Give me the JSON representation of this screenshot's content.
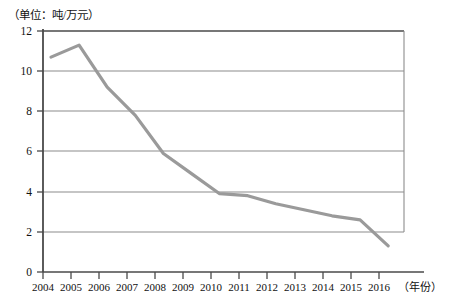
{
  "chart_data": {
    "type": "line",
    "title": "",
    "subtitle": "",
    "unit_label": "（单位：吨/万元）",
    "xlabel": "（年份）",
    "ylabel": "",
    "grid": true,
    "legend": false,
    "legend_position": "none",
    "xlim": [
      2004,
      2016
    ],
    "ylim": [
      0,
      12
    ],
    "ytick_labels": [
      "12",
      "10",
      "8",
      "6",
      "4",
      "2",
      "0"
    ],
    "ytick_values": [
      12,
      10,
      8,
      6,
      4,
      2,
      0
    ],
    "categories": [
      "2004",
      "2005",
      "2006",
      "2007",
      "2008",
      "2009",
      "2010",
      "2011",
      "2012",
      "2013",
      "2014",
      "2015",
      "2016"
    ],
    "x": [
      2004,
      2005,
      2006,
      2007,
      2008,
      2009,
      2010,
      2011,
      2012,
      2013,
      2014,
      2015,
      2016
    ],
    "values": [
      10.7,
      11.3,
      9.2,
      7.8,
      5.9,
      4.9,
      3.9,
      3.8,
      3.4,
      3.1,
      2.8,
      2.6,
      1.3
    ],
    "series": [
      {
        "name": "能耗",
        "values": [
          10.7,
          11.3,
          9.2,
          7.8,
          5.9,
          4.9,
          3.9,
          3.8,
          3.4,
          3.1,
          2.8,
          2.6,
          1.3
        ]
      }
    ],
    "colors": {
      "line": "#9a9a9a",
      "grid": "#8c8c8c",
      "axis": "#555555",
      "text": "#111111",
      "background": "#ffffff"
    }
  }
}
